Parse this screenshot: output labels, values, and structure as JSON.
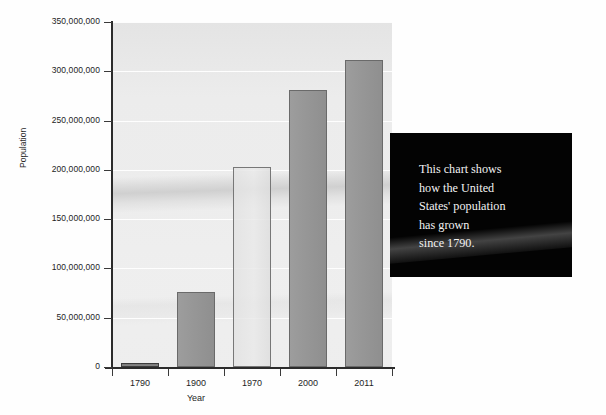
{
  "chart_data": {
    "type": "bar",
    "title": "",
    "subtitle": "",
    "xlabel": "Year",
    "ylabel": "Population",
    "categories": [
      "1790",
      "1900",
      "1970",
      "2000",
      "2011"
    ],
    "values": [
      3929214,
      76212168,
      203211926,
      281421906,
      311591917
    ],
    "ylim": [
      0,
      350000000
    ],
    "ytick_values": [
      0,
      50000000,
      100000000,
      150000000,
      200000000,
      250000000,
      300000000,
      350000000
    ],
    "ytick_labels": [
      "0",
      "50,000,000",
      "100,000,000",
      "150,000,000",
      "200,000,000",
      "250,000,000",
      "300,000,000",
      "350,000,000"
    ],
    "grid": true,
    "grid_axis": "y",
    "legend": false,
    "legend_position": "none",
    "bar_styles": [
      "solid",
      "solid",
      "light",
      "solid",
      "solid"
    ],
    "colors": {
      "bar_fill": "#979797",
      "bar_fill_light": "#e7e7e7",
      "bar_border": "#6d6d6d",
      "plot_background": "#ececec",
      "axis": "#2b2b2b",
      "gridline": "#ffffff",
      "text": "#1f1f1f",
      "callout_background": "#030303",
      "callout_text": "#f2f2f2"
    }
  },
  "annotation": {
    "callout_text": "This chart shows\nhow the United\nStates' population\nhas grown\nsince 1790."
  }
}
